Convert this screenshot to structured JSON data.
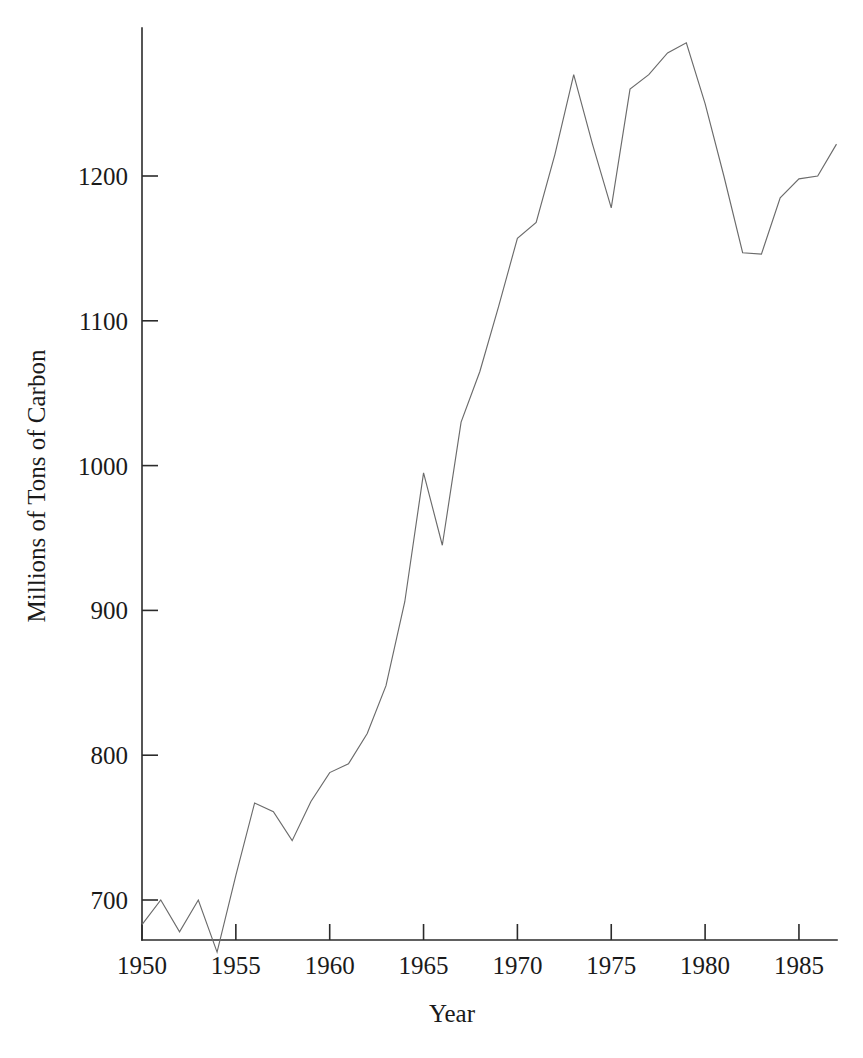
{
  "chart_data": {
    "type": "line",
    "title": "",
    "subtitle": "",
    "xlabel": "Year",
    "ylabel": "Millions of Tons of Carbon",
    "xlim": [
      1949.6,
      1987.4
    ],
    "ylim": [
      660,
      1300
    ],
    "xticks": [
      1950,
      1955,
      1960,
      1965,
      1970,
      1975,
      1980,
      1985
    ],
    "xticklabels": [
      "1950",
      "1955",
      "1960",
      "1965",
      "1970",
      "1975",
      "1980",
      "1985"
    ],
    "yticks": [
      700,
      800,
      900,
      1000,
      1100,
      1200
    ],
    "yticklabels": [
      "700",
      "800",
      "900",
      "1000",
      "1100",
      "1200"
    ],
    "grid": false,
    "legend": false,
    "legend_position": "none",
    "line_color": "#6b6b6b",
    "axis_color": "#2b2b2b",
    "background_color": "#ffffff",
    "x": [
      1950,
      1951,
      1952,
      1953,
      1954,
      1955,
      1956,
      1957,
      1958,
      1959,
      1960,
      1961,
      1962,
      1963,
      1964,
      1965,
      1966,
      1967,
      1968,
      1969,
      1970,
      1971,
      1972,
      1973,
      1974,
      1975,
      1976,
      1977,
      1978,
      1979,
      1980,
      1981,
      1982,
      1983,
      1984,
      1985,
      1986,
      1987
    ],
    "values": [
      683,
      700,
      678,
      700,
      664,
      717,
      767,
      761,
      741,
      768,
      788,
      794,
      815,
      848,
      906,
      995,
      945,
      1030,
      1065,
      1110,
      1157,
      1168,
      1215,
      1270,
      1222,
      1178,
      1260,
      1270,
      1285,
      1292,
      1250,
      1200,
      1147,
      1146,
      1185,
      1198,
      1200,
      1222
    ],
    "series": [
      {
        "name": "Global carbon emissions",
        "values": [
          683,
          700,
          678,
          700,
          664,
          717,
          767,
          761,
          741,
          768,
          788,
          794,
          815,
          848,
          906,
          995,
          945,
          1030,
          1065,
          1110,
          1157,
          1168,
          1215,
          1270,
          1222,
          1178,
          1260,
          1270,
          1285,
          1292,
          1250,
          1200,
          1147,
          1146,
          1185,
          1198,
          1200,
          1222
        ]
      }
    ]
  },
  "geometry": {
    "plot_left": 142,
    "plot_right": 837,
    "plot_bottom": 940,
    "plot_top": 28,
    "x_per_year": 18.77,
    "y_value_1200": 176,
    "y_value_700": 900
  }
}
